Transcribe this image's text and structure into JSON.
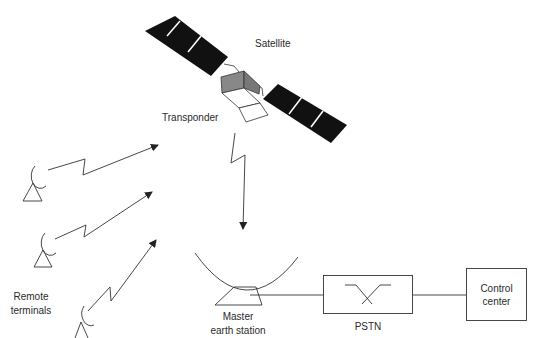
{
  "diagram": {
    "type": "satellite-network",
    "nodes": {
      "satellite": {
        "label": "Satellite"
      },
      "transponder": {
        "label": "Transponder"
      },
      "remote_terminals": {
        "label_line1": "Remote",
        "label_line2": "terminals",
        "count": 3
      },
      "master_earth_station": {
        "label_line1": "Master",
        "label_line2": "earth station"
      },
      "pstn": {
        "label": "PSTN"
      },
      "control_center": {
        "label_line1": "Control",
        "label_line2": "center"
      }
    },
    "links": [
      {
        "from": "remote_terminal_1",
        "to": "satellite",
        "style": "wireless-arrow"
      },
      {
        "from": "remote_terminal_2",
        "to": "satellite",
        "style": "wireless-arrow"
      },
      {
        "from": "remote_terminal_3",
        "to": "satellite",
        "style": "wireless-arrow"
      },
      {
        "from": "satellite",
        "to": "master_earth_station",
        "style": "wireless-arrow"
      },
      {
        "from": "master_earth_station",
        "to": "pstn",
        "style": "line"
      },
      {
        "from": "pstn",
        "to": "control_center",
        "style": "line"
      }
    ],
    "colors": {
      "ink": "#222222",
      "solar_panel": "#111111",
      "transponder_fill": "#888888"
    }
  }
}
